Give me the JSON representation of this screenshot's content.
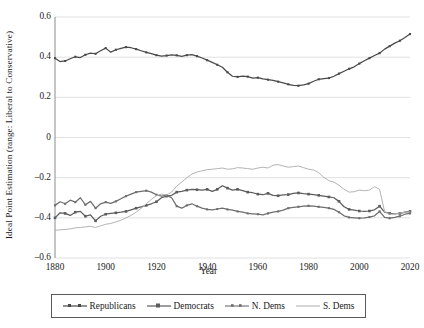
{
  "chart_data": {
    "type": "line",
    "title": "",
    "xlabel": "Year",
    "ylabel": "Ideal Point Estimation (range: Liberal to Conservative)",
    "xlim": [
      1880,
      2020
    ],
    "ylim": [
      -0.6,
      0.6
    ],
    "xticks": [
      "1880",
      "1900",
      "1920",
      "1940",
      "1960",
      "1980",
      "2000",
      "2020"
    ],
    "yticks": [
      "0.6",
      "0.4",
      "0.2",
      "0",
      "–0.2",
      "–0.4",
      "–0.6"
    ],
    "grid": "horizontal",
    "legend_position": "bottom",
    "series": [
      {
        "name": "Republicans",
        "color": "#4a4a4a",
        "marker": "square",
        "x": [
          1880,
          1882,
          1884,
          1886,
          1888,
          1890,
          1892,
          1894,
          1896,
          1898,
          1900,
          1902,
          1904,
          1906,
          1908,
          1910,
          1912,
          1914,
          1916,
          1918,
          1920,
          1922,
          1924,
          1926,
          1928,
          1930,
          1932,
          1934,
          1936,
          1938,
          1940,
          1942,
          1944,
          1946,
          1948,
          1950,
          1952,
          1954,
          1956,
          1958,
          1960,
          1962,
          1964,
          1966,
          1968,
          1970,
          1972,
          1974,
          1976,
          1978,
          1980,
          1982,
          1984,
          1986,
          1988,
          1990,
          1992,
          1994,
          1996,
          1998,
          2000,
          2002,
          2004,
          2006,
          2008,
          2010,
          2012,
          2014,
          2016,
          2018,
          2020
        ],
        "values": [
          0.395,
          0.378,
          0.381,
          0.392,
          0.402,
          0.398,
          0.412,
          0.42,
          0.417,
          0.432,
          0.445,
          0.425,
          0.437,
          0.444,
          0.45,
          0.447,
          0.44,
          0.432,
          0.424,
          0.418,
          0.41,
          0.405,
          0.408,
          0.412,
          0.409,
          0.404,
          0.41,
          0.413,
          0.405,
          0.396,
          0.385,
          0.374,
          0.362,
          0.35,
          0.325,
          0.305,
          0.302,
          0.306,
          0.303,
          0.296,
          0.298,
          0.292,
          0.288,
          0.284,
          0.278,
          0.272,
          0.265,
          0.26,
          0.258,
          0.262,
          0.268,
          0.28,
          0.29,
          0.293,
          0.296,
          0.305,
          0.318,
          0.33,
          0.342,
          0.352,
          0.368,
          0.382,
          0.395,
          0.408,
          0.42,
          0.44,
          0.455,
          0.47,
          0.482,
          0.498,
          0.515
        ]
      },
      {
        "name": "Democrats",
        "color": "#5c5c5c",
        "marker": "square",
        "x": [
          1880,
          1882,
          1884,
          1886,
          1888,
          1890,
          1892,
          1894,
          1896,
          1898,
          1900,
          1902,
          1904,
          1906,
          1908,
          1910,
          1912,
          1914,
          1916,
          1918,
          1920,
          1922,
          1924,
          1926,
          1928,
          1930,
          1932,
          1934,
          1936,
          1938,
          1940,
          1942,
          1944,
          1946,
          1948,
          1950,
          1952,
          1954,
          1956,
          1958,
          1960,
          1962,
          1964,
          1966,
          1968,
          1970,
          1972,
          1974,
          1976,
          1978,
          1980,
          1982,
          1984,
          1986,
          1988,
          1990,
          1992,
          1994,
          1996,
          1998,
          2000,
          2002,
          2004,
          2006,
          2008,
          2010,
          2012,
          2014,
          2016,
          2018,
          2020
        ],
        "values": [
          -0.4,
          -0.375,
          -0.378,
          -0.388,
          -0.372,
          -0.368,
          -0.392,
          -0.385,
          -0.415,
          -0.392,
          -0.382,
          -0.378,
          -0.375,
          -0.372,
          -0.368,
          -0.36,
          -0.352,
          -0.345,
          -0.338,
          -0.33,
          -0.32,
          -0.3,
          -0.292,
          -0.288,
          -0.272,
          -0.268,
          -0.262,
          -0.258,
          -0.26,
          -0.262,
          -0.258,
          -0.268,
          -0.258,
          -0.24,
          -0.252,
          -0.262,
          -0.258,
          -0.265,
          -0.272,
          -0.275,
          -0.282,
          -0.285,
          -0.278,
          -0.288,
          -0.29,
          -0.286,
          -0.284,
          -0.278,
          -0.276,
          -0.28,
          -0.282,
          -0.285,
          -0.288,
          -0.292,
          -0.296,
          -0.3,
          -0.318,
          -0.345,
          -0.358,
          -0.362,
          -0.366,
          -0.368,
          -0.366,
          -0.36,
          -0.342,
          -0.372,
          -0.378,
          -0.38,
          -0.378,
          -0.372,
          -0.368
        ]
      },
      {
        "name": "N. Dems",
        "color": "#6e6e6e",
        "marker": "square",
        "x": [
          1880,
          1882,
          1884,
          1886,
          1888,
          1890,
          1892,
          1894,
          1896,
          1898,
          1900,
          1902,
          1904,
          1906,
          1908,
          1910,
          1912,
          1914,
          1916,
          1918,
          1920,
          1922,
          1924,
          1926,
          1928,
          1930,
          1932,
          1934,
          1936,
          1938,
          1940,
          1942,
          1944,
          1946,
          1948,
          1950,
          1952,
          1954,
          1956,
          1958,
          1960,
          1962,
          1964,
          1966,
          1968,
          1970,
          1972,
          1974,
          1976,
          1978,
          1980,
          1982,
          1984,
          1986,
          1988,
          1990,
          1992,
          1994,
          1996,
          1998,
          2000,
          2002,
          2004,
          2006,
          2008,
          2010,
          2012,
          2014,
          2016,
          2018,
          2020
        ],
        "values": [
          -0.338,
          -0.32,
          -0.33,
          -0.312,
          -0.322,
          -0.3,
          -0.335,
          -0.318,
          -0.352,
          -0.33,
          -0.322,
          -0.328,
          -0.318,
          -0.305,
          -0.292,
          -0.282,
          -0.272,
          -0.268,
          -0.265,
          -0.272,
          -0.285,
          -0.292,
          -0.288,
          -0.3,
          -0.342,
          -0.352,
          -0.338,
          -0.33,
          -0.342,
          -0.352,
          -0.358,
          -0.36,
          -0.356,
          -0.352,
          -0.358,
          -0.362,
          -0.368,
          -0.372,
          -0.378,
          -0.38,
          -0.382,
          -0.385,
          -0.378,
          -0.372,
          -0.368,
          -0.362,
          -0.352,
          -0.348,
          -0.345,
          -0.342,
          -0.34,
          -0.342,
          -0.345,
          -0.348,
          -0.352,
          -0.358,
          -0.372,
          -0.39,
          -0.398,
          -0.4,
          -0.402,
          -0.4,
          -0.396,
          -0.39,
          -0.368,
          -0.398,
          -0.402,
          -0.398,
          -0.392,
          -0.382,
          -0.378
        ]
      },
      {
        "name": "S. Dems",
        "color": "#b4b4b4",
        "marker": "square",
        "x": [
          1880,
          1882,
          1884,
          1886,
          1888,
          1890,
          1892,
          1894,
          1896,
          1898,
          1900,
          1902,
          1904,
          1906,
          1908,
          1910,
          1912,
          1914,
          1916,
          1918,
          1920,
          1922,
          1924,
          1926,
          1928,
          1930,
          1932,
          1934,
          1936,
          1938,
          1940,
          1942,
          1944,
          1946,
          1948,
          1950,
          1952,
          1954,
          1956,
          1958,
          1960,
          1962,
          1964,
          1966,
          1968,
          1970,
          1972,
          1974,
          1976,
          1978,
          1980,
          1982,
          1984,
          1986,
          1988,
          1990,
          1992,
          1994,
          1996,
          1998,
          2000,
          2002,
          2004,
          2006,
          2008,
          2010,
          2012,
          2014,
          2016,
          2018,
          2020
        ],
        "values": [
          -0.462,
          -0.46,
          -0.458,
          -0.455,
          -0.45,
          -0.448,
          -0.445,
          -0.442,
          -0.448,
          -0.44,
          -0.432,
          -0.428,
          -0.42,
          -0.412,
          -0.4,
          -0.388,
          -0.372,
          -0.352,
          -0.33,
          -0.308,
          -0.29,
          -0.282,
          -0.286,
          -0.272,
          -0.242,
          -0.222,
          -0.2,
          -0.182,
          -0.172,
          -0.166,
          -0.16,
          -0.158,
          -0.155,
          -0.152,
          -0.158,
          -0.156,
          -0.15,
          -0.152,
          -0.155,
          -0.158,
          -0.152,
          -0.148,
          -0.152,
          -0.138,
          -0.135,
          -0.142,
          -0.148,
          -0.145,
          -0.142,
          -0.15,
          -0.158,
          -0.162,
          -0.175,
          -0.198,
          -0.215,
          -0.222,
          -0.238,
          -0.258,
          -0.272,
          -0.27,
          -0.262,
          -0.265,
          -0.262,
          -0.245,
          -0.258,
          -0.37,
          -0.382,
          -0.38,
          -0.376,
          -0.372,
          -0.37
        ]
      }
    ]
  },
  "legend": {
    "items": [
      {
        "label": "Republicans"
      },
      {
        "label": "Democrats"
      },
      {
        "label": "N. Dems"
      },
      {
        "label": "S. Dems"
      }
    ]
  },
  "axes": {
    "y_title": "Ideal Point Estimation (range: Liberal to Conservative)",
    "x_title": "Year"
  }
}
